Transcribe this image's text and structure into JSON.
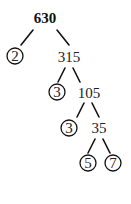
{
  "diagram": {
    "type": "factor-tree",
    "root": "630",
    "nodes": [
      {
        "id": "n630",
        "label": "630",
        "x": 45,
        "y": 23,
        "circled": false,
        "bold": true
      },
      {
        "id": "n2",
        "label": "2",
        "x": 15,
        "y": 61,
        "circled": true
      },
      {
        "id": "n315",
        "label": "315",
        "x": 69,
        "y": 62,
        "circled": false
      },
      {
        "id": "n3a",
        "label": "3",
        "x": 57,
        "y": 97,
        "circled": true
      },
      {
        "id": "n105",
        "label": "105",
        "x": 89,
        "y": 98,
        "circled": false
      },
      {
        "id": "n3b",
        "label": "3",
        "x": 69,
        "y": 133,
        "circled": true
      },
      {
        "id": "n35",
        "label": "35",
        "x": 99,
        "y": 133,
        "circled": false
      },
      {
        "id": "n5",
        "label": "5",
        "x": 88,
        "y": 168,
        "circled": true
      },
      {
        "id": "n7",
        "label": "7",
        "x": 113,
        "y": 168,
        "circled": true
      }
    ],
    "edges": [
      [
        "630",
        "2"
      ],
      [
        "630",
        "315"
      ],
      [
        "315",
        "3"
      ],
      [
        "315",
        "105"
      ],
      [
        "105",
        "3"
      ],
      [
        "105",
        "35"
      ],
      [
        "35",
        "5"
      ],
      [
        "35",
        "7"
      ]
    ],
    "prime_factors": [
      "2",
      "3",
      "3",
      "5",
      "7"
    ]
  }
}
